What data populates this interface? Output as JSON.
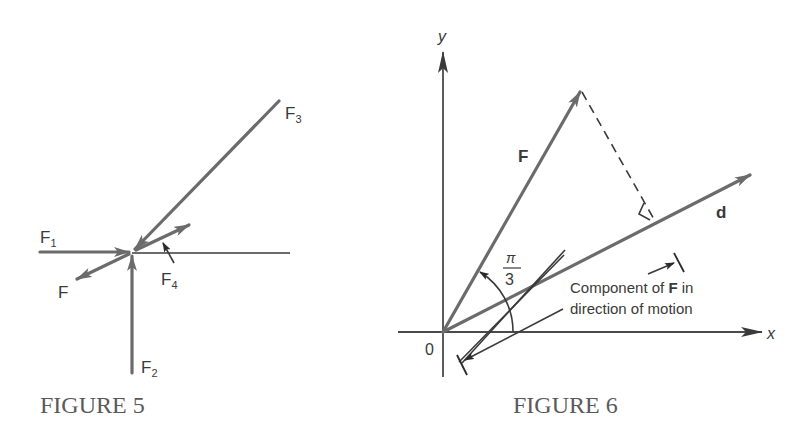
{
  "figure5": {
    "caption": "FIGURE 5",
    "labels": {
      "F1": "F",
      "F1_sub": "1",
      "F2": "F",
      "F2_sub": "2",
      "F3": "F",
      "F3_sub": "3",
      "F4": "F",
      "F4_sub": "4",
      "F": "F"
    }
  },
  "figure6": {
    "caption": "FIGURE 6",
    "labels": {
      "y_axis": "y",
      "x_axis": "x",
      "origin": "0",
      "force": "F",
      "direction": "d",
      "angle_num": "π",
      "angle_den": "3",
      "component_line1_a": "Component of ",
      "component_line1_b": "F",
      "component_line1_c": " in",
      "component_line2": "direction of motion"
    }
  },
  "colors": {
    "vector": "#6b6b6b",
    "text": "#3a3a3a",
    "caption": "#5a5a5a",
    "background": "#ffffff"
  }
}
